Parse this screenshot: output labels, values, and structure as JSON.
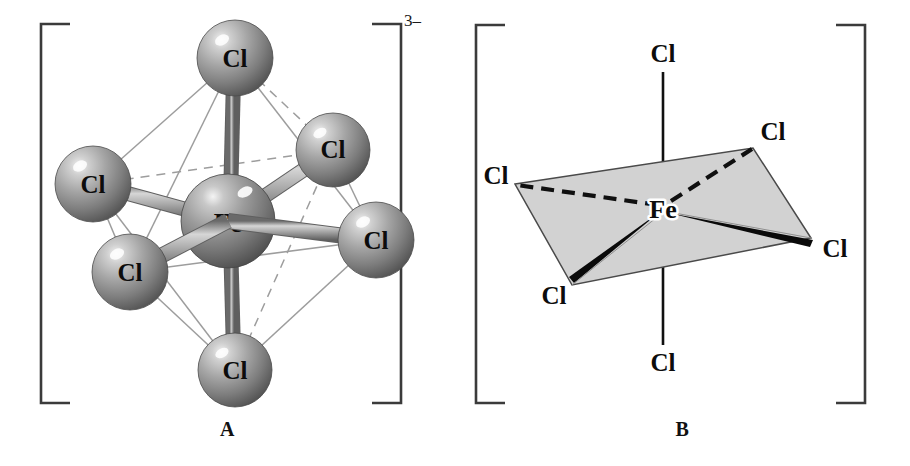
{
  "figure": {
    "background_color": "#ffffff",
    "panels": [
      {
        "id": "A",
        "label": "A",
        "style": "ball-and-stick octahedron",
        "charge": "3",
        "charge_sign": "–",
        "bracket_color": "#3b3b3b",
        "center_atom": {
          "symbol": "Fe",
          "cx": 228,
          "cy": 221,
          "r": 47
        },
        "ligand_atoms": [
          {
            "symbol": "Cl",
            "position": "top-axial",
            "cx": 235,
            "cy": 58,
            "r": 38
          },
          {
            "symbol": "Cl",
            "position": "bottom-axial",
            "cx": 235,
            "cy": 370,
            "r": 37
          },
          {
            "symbol": "Cl",
            "position": "left-rear",
            "cx": 93,
            "cy": 184,
            "r": 38
          },
          {
            "symbol": "Cl",
            "position": "right-rear",
            "cx": 333,
            "cy": 150,
            "r": 37
          },
          {
            "symbol": "Cl",
            "position": "left-front",
            "cx": 130,
            "cy": 272,
            "r": 38
          },
          {
            "symbol": "Cl",
            "position": "right-front",
            "cx": 376,
            "cy": 240,
            "r": 38
          }
        ],
        "sphere_colors": {
          "highlight": "#e9e9e9",
          "mid": "#a3a3a3",
          "shadow": "#555555"
        },
        "bond_colors": {
          "highlight": "#d8d8d8",
          "mid": "#9d9d9d",
          "shadow": "#5e5e5e"
        },
        "edge_line_color": "#9a9a9a"
      },
      {
        "id": "B",
        "label": "B",
        "style": "line drawing with shaded equatorial plane",
        "charge": "3",
        "charge_sign": "–",
        "bracket_color": "#3b3b3b",
        "plane_fill": "#d2d2d2",
        "plane_stroke": "#4a4a4a",
        "center_atom": {
          "symbol": "Fe",
          "x": 663,
          "y": 208
        },
        "ligand_labels": [
          {
            "symbol": "Cl",
            "position": "top-axial",
            "x": 661,
            "y": 55
          },
          {
            "symbol": "Cl",
            "position": "bottom-axial",
            "x": 661,
            "y": 363
          },
          {
            "symbol": "Cl",
            "position": "left-rear",
            "x": 514,
            "y": 178,
            "bond": "dashed"
          },
          {
            "symbol": "Cl",
            "position": "right-rear",
            "x": 772,
            "y": 140,
            "bond": "dashed"
          },
          {
            "symbol": "Cl",
            "position": "left-front",
            "x": 553,
            "y": 286,
            "bond": "wedge"
          },
          {
            "symbol": "Cl",
            "position": "right-front",
            "x": 818,
            "y": 249,
            "bond": "wedge"
          }
        ],
        "bond_types": {
          "axial": "plain-line",
          "rear": "dashed-line",
          "front": "bold-wedge"
        }
      }
    ]
  }
}
